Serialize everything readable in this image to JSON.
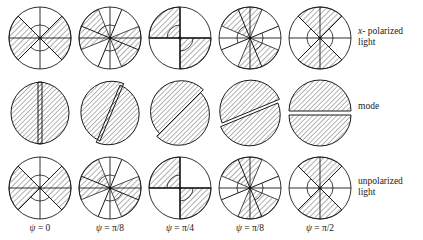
{
  "figure": {
    "type": "scientific-diagram-grid",
    "rows": 3,
    "columns": 5,
    "ink_color": "#1a1a1a",
    "background_color": "#ffffff",
    "hatch_color": "#1a1a1a"
  },
  "row_labels": [
    {
      "id": "x-polarized-light",
      "line1": "x- polarized",
      "line2": "light",
      "italic_lead": "x"
    },
    {
      "id": "mode",
      "line1": "mode",
      "line2": ""
    },
    {
      "id": "unpolarized-light",
      "line1": "unpolarized",
      "line2": "light"
    }
  ],
  "column_labels": [
    {
      "id": "psi-0",
      "symbol": "ψ",
      "equals": "=",
      "value": "0"
    },
    {
      "id": "psi-pi-8",
      "symbol": "ψ",
      "equals": "=",
      "value": "π/8"
    },
    {
      "id": "psi-pi-4",
      "symbol": "ψ",
      "equals": "=",
      "value": "π/4"
    },
    {
      "id": "psi-pi-8-b",
      "symbol": "ψ",
      "equals": "=",
      "value": "π/8"
    },
    {
      "id": "psi-pi-2",
      "symbol": "ψ",
      "equals": "=",
      "value": "π/2"
    }
  ],
  "chart_data": {
    "type": "diagram",
    "title": "",
    "psi_values": [
      "0",
      "π/8",
      "τ/4",
      "π/8",
      "π/2"
    ],
    "psi_angles_deg": [
      0,
      22.5,
      45,
      67.5,
      90
    ],
    "rows": [
      {
        "name": "x- polarized light",
        "style": "crossed-sectors",
        "cells": [
          {
            "psi_deg": 0,
            "diag_rotation_deg": 0,
            "hatched_sectors": [
              [
                135,
                225
              ],
              [
                315,
                405
              ]
            ],
            "inner_arc_radius": 0.42,
            "has_axes": true
          },
          {
            "psi_deg": 22.5,
            "diag_rotation_deg": 22.5,
            "hatched_sectors": [
              [
                112,
                202
              ],
              [
                292,
                382
              ]
            ],
            "inner_arc_radius": 0.42,
            "has_axes": true
          },
          {
            "psi_deg": 45,
            "diag_rotation_deg": 45,
            "hatched_sectors": [
              [
                90,
                180
              ],
              [
                270,
                360
              ]
            ],
            "inner_arc_radius": 0.42,
            "has_axes": true
          },
          {
            "psi_deg": 67.5,
            "diag_rotation_deg": 67.5,
            "hatched_sectors": [
              [
                67,
                157
              ],
              [
                247,
                337
              ]
            ],
            "inner_arc_radius": 0.42,
            "has_axes": true
          },
          {
            "psi_deg": 90,
            "diag_rotation_deg": 90,
            "hatched_sectors": [
              [
                45,
                135
              ],
              [
                225,
                315
              ]
            ],
            "inner_arc_radius": 0.42,
            "has_axes": true
          }
        ]
      },
      {
        "name": "mode",
        "style": "split-halves",
        "cells": [
          {
            "psi_deg": 0,
            "split_angle_deg": 90
          },
          {
            "psi_deg": 22.5,
            "split_angle_deg": 67.5
          },
          {
            "psi_deg": 45,
            "split_angle_deg": 45
          },
          {
            "psi_deg": 67.5,
            "split_angle_deg": 22.5
          },
          {
            "psi_deg": 90,
            "split_angle_deg": 0
          }
        ]
      },
      {
        "name": "unpolarized light",
        "style": "crossed-sectors",
        "cells": [
          {
            "psi_deg": 0,
            "diag_rotation_deg": 0,
            "hatched_sectors": [
              [
                135,
                225
              ],
              [
                315,
                405
              ]
            ],
            "inner_arc_radius": 0.42,
            "has_axes": true
          },
          {
            "psi_deg": 22.5,
            "diag_rotation_deg": 22.5,
            "hatched_sectors": [
              [
                112,
                202
              ],
              [
                292,
                382
              ]
            ],
            "inner_arc_radius": 0.42,
            "has_axes": true
          },
          {
            "psi_deg": 45,
            "diag_rotation_deg": 45,
            "hatched_sectors": [
              [
                90,
                180
              ],
              [
                270,
                360
              ]
            ],
            "inner_arc_radius": 0.42,
            "has_axes": true
          },
          {
            "psi_deg": 67.5,
            "diag_rotation_deg": 67.5,
            "hatched_sectors": [
              [
                67,
                157
              ],
              [
                247,
                337
              ]
            ],
            "inner_arc_radius": 0.42,
            "has_axes": true
          },
          {
            "psi_deg": 90,
            "diag_rotation_deg": 90,
            "hatched_sectors": [
              [
                45,
                135
              ],
              [
                225,
                315
              ]
            ],
            "inner_arc_radius": 0.42,
            "has_axes": true
          }
        ]
      }
    ],
    "geometry": {
      "circle_radius": 31,
      "column_centers_x": [
        40,
        110,
        180,
        250,
        320
      ],
      "row_centers_y": [
        38,
        113,
        188
      ],
      "row_label_x": 358,
      "column_label_y": 231
    }
  }
}
